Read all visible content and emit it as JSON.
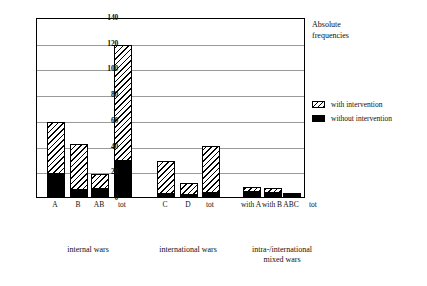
{
  "chart_data": {
    "type": "bar",
    "title": "Absolute\nfrequencies",
    "xlabel": "",
    "ylabel": "",
    "ylim": [
      0,
      140
    ],
    "yticks": [
      0,
      20,
      40,
      60,
      80,
      100,
      120,
      140
    ],
    "grid": true,
    "stacked": true,
    "legend_position": "right",
    "legend": [
      {
        "name": "with intervention",
        "pattern": "diagonal-hatch",
        "color": "#000000"
      },
      {
        "name": "without intervention",
        "pattern": "solid",
        "color": "#000000"
      }
    ],
    "categories": [
      "A",
      "B",
      "AB",
      "tot",
      "C",
      "D",
      "tot",
      "with A",
      "with B",
      "ABC",
      "tot"
    ],
    "series": [
      {
        "name": "without intervention",
        "values": [
          19,
          6,
          7,
          29,
          3,
          2,
          4,
          5,
          4,
          2,
          9
        ]
      },
      {
        "name": "with intervention",
        "values": [
          39,
          35,
          11,
          89,
          25,
          9,
          36,
          3,
          3,
          1,
          9
        ]
      }
    ],
    "totals": [
      58,
      41,
      18,
      118,
      28,
      11,
      40,
      8,
      7,
      3,
      18
    ],
    "groups": [
      {
        "label": "internal wars",
        "categories": [
          "A",
          "B",
          "AB",
          "tot"
        ]
      },
      {
        "label": "international wars",
        "categories": [
          "C",
          "D",
          "tot"
        ]
      },
      {
        "label": "intra-/international\nmixed wars",
        "categories": [
          "with A",
          "with B",
          "ABC",
          "tot"
        ]
      }
    ]
  }
}
